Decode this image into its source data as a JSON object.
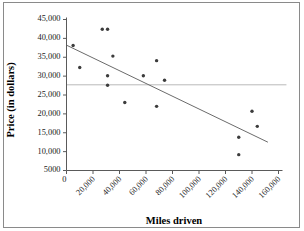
{
  "chart_data": {
    "type": "scatter",
    "title": "",
    "xlabel": "Miles driven",
    "ylabel": "Price (in dollars)",
    "xlim": [
      0,
      160000
    ],
    "ylim": [
      5000,
      45000
    ],
    "grid": false,
    "legend": "none",
    "x_ticks": [
      0,
      20000,
      40000,
      60000,
      80000,
      100000,
      120000,
      140000,
      160000
    ],
    "x_tick_labels": [
      "0",
      "20,000",
      "40,000",
      "60,000",
      "80,000",
      "100,000",
      "120,000",
      "140,000",
      "160,000"
    ],
    "y_ticks": [
      5000,
      10000,
      15000,
      20000,
      25000,
      30000,
      35000,
      40000,
      45000
    ],
    "y_tick_labels": [
      "5000",
      "10,000",
      "15,000",
      "20,000",
      "25,000",
      "30,000",
      "35,000",
      "40,000",
      "45,000"
    ],
    "x": [
      5000,
      10000,
      27000,
      31000,
      31000,
      31000,
      35000,
      44000,
      58000,
      68000,
      68000,
      74000,
      130000,
      130000,
      140000,
      144000
    ],
    "y": [
      38100,
      32300,
      42400,
      42400,
      30100,
      27600,
      35300,
      23000,
      30100,
      34100,
      22000,
      28900,
      13800,
      9200,
      20700,
      16700
    ],
    "points": [
      {
        "x": 5000,
        "y": 38100
      },
      {
        "x": 10000,
        "y": 32300
      },
      {
        "x": 27000,
        "y": 42400
      },
      {
        "x": 31000,
        "y": 42400
      },
      {
        "x": 31000,
        "y": 30100
      },
      {
        "x": 31000,
        "y": 27600
      },
      {
        "x": 35000,
        "y": 35300
      },
      {
        "x": 44000,
        "y": 23000
      },
      {
        "x": 58000,
        "y": 30100
      },
      {
        "x": 68000,
        "y": 34100
      },
      {
        "x": 68000,
        "y": 22000
      },
      {
        "x": 74000,
        "y": 28900
      },
      {
        "x": 130000,
        "y": 13800
      },
      {
        "x": 130000,
        "y": 9200
      },
      {
        "x": 140000,
        "y": 20700
      },
      {
        "x": 144000,
        "y": 16700
      }
    ],
    "annotations": [
      {
        "name": "trend-line",
        "type": "line",
        "x0": 0,
        "y0": 38200,
        "x1": 152000,
        "y1": 12500
      },
      {
        "name": "mean-line",
        "type": "horizontal-line",
        "y": 27700,
        "x0": 0,
        "x1": 166000
      }
    ],
    "colors": {
      "point": "#3c3c3c",
      "trend_line": "#6b6b6b",
      "mean_line": "#b9b9b9",
      "axis": "#5a5a5a",
      "text": "#1a1a1a",
      "frame": "#8a8a8a",
      "background": "#ffffff"
    }
  }
}
